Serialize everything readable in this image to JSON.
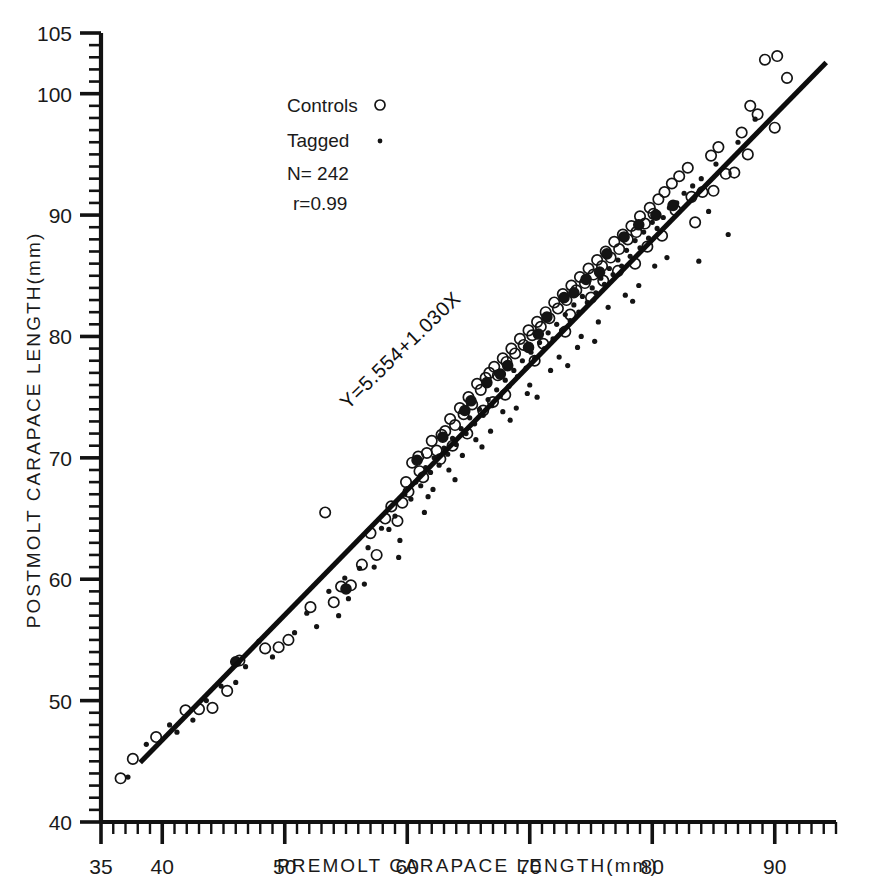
{
  "figure": {
    "background": "#ffffff",
    "ink": "#141414"
  },
  "chart_data": {
    "type": "scatter",
    "title": "",
    "xlabel": "PREMOLT CARAPACE LENGTH(mm)",
    "ylabel": "POSTMOLT CARAPACE LENGTH(mm)",
    "xlim": [
      35,
      95
    ],
    "ylim": [
      40,
      105
    ],
    "grid": false,
    "legend_position": "upper-left-inside",
    "x_major_ticks": [
      35,
      40,
      50,
      60,
      70,
      80,
      90
    ],
    "x_tick_labels": [
      "35",
      "40",
      "50",
      "60",
      "70",
      "80",
      "90"
    ],
    "x_minor_tick_step": 1,
    "y_major_ticks": [
      40,
      50,
      60,
      70,
      80,
      90,
      100,
      105
    ],
    "y_tick_labels": [
      "40",
      "50",
      "60",
      "70",
      "80",
      "90",
      "100",
      "105"
    ],
    "y_minor_tick_step": 1,
    "annotations": [
      {
        "name": "regression-equation",
        "text": "Y=5.554+1.030X",
        "rotation": -44
      }
    ],
    "legend": [
      {
        "label": "Controls",
        "marker": "open-circle"
      },
      {
        "label": "Tagged",
        "marker": "small-dot"
      }
    ],
    "stats": [
      {
        "label": "N=",
        "value": "242",
        "text": "N= 242"
      },
      {
        "label": "r=",
        "value": "0.99",
        "text": "r=0.99"
      }
    ],
    "fit": {
      "intercept": 5.554,
      "slope": 1.03,
      "equation": "Y=5.554+1.030X",
      "correlation": 0.99,
      "n": 242,
      "x_start": 38.2,
      "x_end": 94.2
    },
    "series": [
      {
        "name": "Controls",
        "marker": "open-circle",
        "points": [
          [
            36.6,
            43.6
          ],
          [
            37.6,
            45.2
          ],
          [
            39.5,
            47.0
          ],
          [
            41.9,
            49.2
          ],
          [
            43.0,
            49.3
          ],
          [
            44.1,
            49.4
          ],
          [
            45.3,
            50.8
          ],
          [
            46.3,
            53.3
          ],
          [
            48.4,
            54.3
          ],
          [
            49.5,
            54.4
          ],
          [
            52.1,
            57.7
          ],
          [
            53.3,
            65.5
          ],
          [
            54.6,
            59.4
          ],
          [
            55.4,
            59.5
          ],
          [
            57.0,
            63.8
          ],
          [
            58.2,
            65.0
          ],
          [
            58.7,
            66.0
          ],
          [
            59.2,
            64.8
          ],
          [
            59.6,
            66.3
          ],
          [
            60.1,
            67.2
          ],
          [
            60.4,
            69.6
          ],
          [
            60.9,
            70.1
          ],
          [
            61.3,
            68.4
          ],
          [
            61.6,
            70.4
          ],
          [
            62.0,
            71.4
          ],
          [
            62.4,
            70.6
          ],
          [
            62.8,
            71.9
          ],
          [
            63.1,
            72.2
          ],
          [
            63.5,
            73.2
          ],
          [
            63.9,
            72.7
          ],
          [
            64.3,
            74.1
          ],
          [
            64.6,
            73.6
          ],
          [
            65.0,
            75.0
          ],
          [
            65.3,
            74.4
          ],
          [
            65.7,
            76.1
          ],
          [
            66.0,
            75.6
          ],
          [
            66.4,
            76.6
          ],
          [
            66.7,
            77.0
          ],
          [
            67.1,
            77.5
          ],
          [
            67.4,
            76.8
          ],
          [
            67.8,
            78.2
          ],
          [
            68.1,
            77.9
          ],
          [
            68.5,
            79.0
          ],
          [
            68.8,
            78.6
          ],
          [
            69.2,
            79.8
          ],
          [
            69.5,
            79.3
          ],
          [
            69.9,
            80.5
          ],
          [
            70.2,
            80.1
          ],
          [
            70.6,
            81.2
          ],
          [
            70.9,
            80.8
          ],
          [
            71.3,
            82.0
          ],
          [
            71.6,
            81.5
          ],
          [
            72.0,
            82.8
          ],
          [
            72.3,
            82.3
          ],
          [
            72.7,
            83.5
          ],
          [
            73.0,
            83.0
          ],
          [
            73.4,
            84.2
          ],
          [
            73.8,
            83.8
          ],
          [
            74.1,
            84.9
          ],
          [
            74.5,
            84.4
          ],
          [
            74.8,
            85.6
          ],
          [
            75.2,
            85.1
          ],
          [
            75.5,
            86.3
          ],
          [
            75.9,
            85.8
          ],
          [
            76.2,
            87.0
          ],
          [
            76.6,
            86.5
          ],
          [
            76.9,
            87.8
          ],
          [
            77.3,
            87.2
          ],
          [
            77.6,
            88.4
          ],
          [
            78.0,
            88.0
          ],
          [
            78.3,
            89.1
          ],
          [
            78.7,
            88.6
          ],
          [
            79.0,
            89.9
          ],
          [
            79.4,
            89.3
          ],
          [
            79.8,
            90.6
          ],
          [
            80.1,
            90.1
          ],
          [
            80.5,
            91.3
          ],
          [
            81.0,
            91.9
          ],
          [
            81.6,
            92.6
          ],
          [
            82.2,
            93.2
          ],
          [
            82.9,
            93.9
          ],
          [
            83.5,
            89.4
          ],
          [
            84.1,
            91.9
          ],
          [
            84.8,
            94.9
          ],
          [
            85.4,
            95.6
          ],
          [
            86.0,
            93.4
          ],
          [
            86.7,
            93.5
          ],
          [
            87.3,
            96.8
          ],
          [
            88.0,
            99.0
          ],
          [
            88.6,
            98.3
          ],
          [
            89.2,
            102.8
          ],
          [
            90.0,
            97.2
          ],
          [
            91.0,
            101.3
          ],
          [
            57.5,
            62.0
          ],
          [
            59.9,
            68.0
          ],
          [
            62.7,
            69.9
          ],
          [
            64.9,
            72.0
          ],
          [
            67.0,
            74.6
          ],
          [
            71.1,
            79.4
          ],
          [
            73.3,
            81.8
          ],
          [
            76.0,
            84.6
          ],
          [
            78.6,
            86.0
          ],
          [
            80.8,
            88.3
          ],
          [
            83.2,
            91.5
          ],
          [
            85.0,
            92.0
          ],
          [
            87.8,
            95.0
          ],
          [
            90.2,
            103.1
          ],
          [
            68.0,
            75.2
          ],
          [
            70.4,
            78.0
          ],
          [
            72.9,
            80.4
          ],
          [
            75.0,
            83.2
          ],
          [
            77.2,
            85.4
          ],
          [
            79.6,
            87.4
          ],
          [
            81.9,
            90.4
          ],
          [
            66.2,
            73.9
          ],
          [
            63.7,
            71.0
          ],
          [
            61.0,
            68.9
          ],
          [
            56.3,
            61.2
          ],
          [
            54.0,
            58.1
          ],
          [
            50.3,
            55.0
          ]
        ]
      },
      {
        "name": "Tagged",
        "marker": "small-dot",
        "points": [
          [
            37.2,
            43.7
          ],
          [
            38.7,
            46.4
          ],
          [
            40.6,
            48.0
          ],
          [
            42.5,
            48.4
          ],
          [
            44.8,
            51.2
          ],
          [
            46.8,
            52.8
          ],
          [
            47.9,
            54.9
          ],
          [
            50.8,
            55.6
          ],
          [
            51.8,
            57.2
          ],
          [
            53.6,
            59.0
          ],
          [
            54.9,
            60.1
          ],
          [
            56.1,
            60.9
          ],
          [
            56.8,
            62.6
          ],
          [
            57.9,
            64.2
          ],
          [
            58.5,
            64.1
          ],
          [
            59.0,
            65.2
          ],
          [
            59.8,
            67.0
          ],
          [
            60.3,
            66.6
          ],
          [
            60.7,
            68.0
          ],
          [
            61.1,
            67.7
          ],
          [
            61.5,
            69.2
          ],
          [
            61.9,
            68.8
          ],
          [
            62.2,
            70.0
          ],
          [
            62.6,
            69.4
          ],
          [
            63.0,
            70.8
          ],
          [
            63.3,
            70.3
          ],
          [
            63.7,
            71.6
          ],
          [
            64.0,
            71.1
          ],
          [
            64.4,
            72.4
          ],
          [
            64.8,
            72.0
          ],
          [
            65.1,
            73.3
          ],
          [
            65.5,
            72.8
          ],
          [
            65.9,
            74.0
          ],
          [
            66.2,
            73.5
          ],
          [
            66.6,
            74.8
          ],
          [
            66.9,
            74.3
          ],
          [
            67.3,
            75.6
          ],
          [
            67.6,
            75.1
          ],
          [
            68.0,
            76.4
          ],
          [
            68.3,
            75.9
          ],
          [
            68.7,
            77.2
          ],
          [
            69.0,
            76.7
          ],
          [
            69.4,
            78.0
          ],
          [
            69.7,
            77.4
          ],
          [
            70.1,
            78.7
          ],
          [
            70.4,
            78.2
          ],
          [
            70.8,
            79.5
          ],
          [
            71.2,
            79.0
          ],
          [
            71.5,
            80.3
          ],
          [
            71.9,
            79.8
          ],
          [
            72.2,
            81.0
          ],
          [
            72.6,
            80.5
          ],
          [
            72.9,
            81.8
          ],
          [
            73.3,
            81.3
          ],
          [
            73.6,
            82.6
          ],
          [
            74.0,
            82.0
          ],
          [
            74.3,
            83.3
          ],
          [
            74.7,
            82.8
          ],
          [
            75.1,
            84.0
          ],
          [
            75.4,
            83.6
          ],
          [
            75.8,
            84.8
          ],
          [
            76.1,
            84.3
          ],
          [
            76.5,
            85.6
          ],
          [
            76.8,
            85.1
          ],
          [
            77.2,
            86.3
          ],
          [
            77.5,
            85.8
          ],
          [
            77.9,
            87.1
          ],
          [
            78.2,
            86.6
          ],
          [
            78.6,
            87.9
          ],
          [
            79.0,
            87.3
          ],
          [
            79.3,
            88.6
          ],
          [
            79.7,
            88.1
          ],
          [
            80.0,
            89.4
          ],
          [
            80.4,
            88.9
          ],
          [
            80.9,
            89.8
          ],
          [
            81.4,
            90.6
          ],
          [
            82.0,
            91.0
          ],
          [
            82.6,
            91.8
          ],
          [
            83.3,
            92.4
          ],
          [
            84.0,
            93.0
          ],
          [
            84.6,
            90.3
          ],
          [
            85.2,
            94.2
          ],
          [
            86.2,
            88.4
          ],
          [
            87.0,
            96.0
          ],
          [
            88.4,
            97.9
          ],
          [
            83.8,
            86.2
          ],
          [
            81.2,
            86.5
          ],
          [
            78.9,
            84.2
          ],
          [
            76.4,
            82.4
          ],
          [
            74.2,
            80.0
          ],
          [
            72.4,
            78.3
          ],
          [
            70.0,
            76.0
          ],
          [
            67.8,
            73.8
          ],
          [
            65.6,
            71.5
          ],
          [
            63.4,
            69.0
          ],
          [
            61.7,
            66.8
          ],
          [
            59.4,
            63.2
          ],
          [
            57.3,
            61.0
          ],
          [
            55.2,
            58.4
          ],
          [
            52.6,
            56.1
          ],
          [
            49.0,
            53.6
          ],
          [
            46.0,
            51.5
          ],
          [
            43.6,
            50.0
          ],
          [
            41.2,
            47.4
          ],
          [
            68.9,
            74.1
          ],
          [
            71.7,
            77.2
          ],
          [
            73.9,
            79.1
          ],
          [
            66.8,
            72.2
          ],
          [
            64.5,
            70.2
          ],
          [
            62.1,
            67.4
          ],
          [
            69.8,
            75.3
          ],
          [
            75.6,
            81.2
          ],
          [
            77.8,
            83.4
          ],
          [
            80.2,
            85.8
          ],
          [
            59.3,
            61.8
          ],
          [
            61.4,
            65.5
          ],
          [
            63.9,
            68.2
          ],
          [
            66.1,
            70.9
          ],
          [
            68.4,
            73.1
          ],
          [
            70.6,
            75.0
          ],
          [
            73.1,
            77.6
          ],
          [
            75.3,
            79.6
          ],
          [
            78.4,
            82.9
          ],
          [
            56.5,
            59.6
          ],
          [
            54.4,
            57.0
          ]
        ]
      },
      {
        "name": "Overlapping (control+tagged)",
        "marker": "filled-circle",
        "points": [
          [
            46.0,
            53.2
          ],
          [
            55.0,
            59.2
          ],
          [
            60.8,
            69.8
          ],
          [
            62.9,
            71.7
          ],
          [
            64.7,
            73.9
          ],
          [
            66.5,
            76.2
          ],
          [
            68.2,
            77.6
          ],
          [
            69.9,
            79.1
          ],
          [
            71.4,
            81.6
          ],
          [
            72.8,
            83.2
          ],
          [
            74.6,
            84.7
          ],
          [
            76.3,
            86.8
          ],
          [
            77.7,
            88.2
          ],
          [
            78.9,
            89.2
          ],
          [
            80.3,
            90.0
          ],
          [
            81.7,
            90.8
          ],
          [
            75.7,
            85.3
          ],
          [
            73.6,
            83.6
          ],
          [
            70.7,
            80.2
          ],
          [
            67.6,
            76.9
          ],
          [
            65.2,
            74.7
          ]
        ]
      }
    ]
  },
  "legend_box": {
    "controls_label": "Controls",
    "tagged_label": "Tagged",
    "n_text": "N= 242",
    "r_text": "r=0.99"
  },
  "equation_label": "Y=5.554+1.030X",
  "axes": {
    "x_title": "PREMOLT CARAPACE LENGTH(mm)",
    "y_title": "POSTMOLT CARAPACE LENGTH(mm)"
  }
}
